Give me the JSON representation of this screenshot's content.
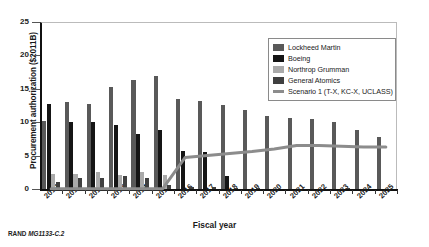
{
  "figure": {
    "source_note_prefix": "RAND",
    "source_note_id": "MG1133-C.2"
  },
  "chart_data": {
    "type": "bar",
    "title": "",
    "xlabel": "Fiscal year",
    "ylabel": "Procurement authorization ($2011B)",
    "categories": [
      "2010",
      "2011",
      "2012",
      "2013",
      "2014",
      "2015",
      "2016",
      "2017",
      "2018",
      "2019",
      "2020",
      "2021",
      "2022",
      "2023",
      "2024",
      "2025"
    ],
    "ylim": [
      0,
      25
    ],
    "yticks": [
      0,
      5,
      10,
      15,
      20,
      25
    ],
    "ytick_labels": [
      "0",
      "5",
      "10",
      "15",
      "20",
      "25"
    ],
    "grid": false,
    "legend_position": "upper right",
    "series": [
      {
        "name": "Lockheed Martin",
        "color": "#595959",
        "values": [
          10.2,
          13.1,
          12.8,
          15.2,
          16.3,
          16.9,
          13.5,
          13.2,
          12.6,
          11.8,
          11.0,
          10.7,
          10.5,
          10.1,
          8.9,
          7.8
        ]
      },
      {
        "name": "Boeing",
        "color": "#151515",
        "values": [
          12.8,
          10.0,
          10.1,
          9.6,
          8.2,
          8.9,
          5.7,
          5.5,
          2.0,
          0.0,
          0.0,
          0.0,
          0.0,
          0.0,
          0.0,
          0.0
        ]
      },
      {
        "name": "Northrop Grumman",
        "color": "#aaaaaa",
        "values": [
          2.3,
          2.3,
          2.5,
          2.1,
          2.5,
          2.1,
          0.0,
          0.0,
          0.0,
          0.0,
          0.0,
          0.0,
          0.0,
          0.0,
          0.0,
          0.0
        ]
      },
      {
        "name": "General Atomics",
        "color": "#404040",
        "values": [
          1.0,
          1.7,
          1.6,
          1.9,
          1.7,
          0.6,
          0.3,
          0.3,
          0.2,
          0.1,
          0.0,
          0.0,
          0.0,
          0.1,
          0.0,
          0.0
        ]
      }
    ],
    "line_series": {
      "name": "Scenario 1 (T-X, KC-X, UCLASS)",
      "color": "#8c8c8c",
      "values": [
        0.05,
        0.05,
        0.05,
        0.05,
        0.05,
        0.05,
        4.7,
        5.0,
        5.3,
        5.6,
        6.0,
        6.5,
        6.5,
        6.4,
        6.3,
        6.3
      ]
    },
    "legend": [
      {
        "label": "Lockheed Martin",
        "color": "#595959",
        "marker": "square"
      },
      {
        "label": "Boeing",
        "color": "#151515",
        "marker": "square"
      },
      {
        "label": "Northrop Grumman",
        "color": "#aaaaaa",
        "marker": "square"
      },
      {
        "label": "General Atomics",
        "color": "#404040",
        "marker": "square"
      },
      {
        "label": "Scenario 1 (T-X, KC-X, UCLASS)",
        "color": "#8c8c8c",
        "marker": "line"
      }
    ]
  }
}
